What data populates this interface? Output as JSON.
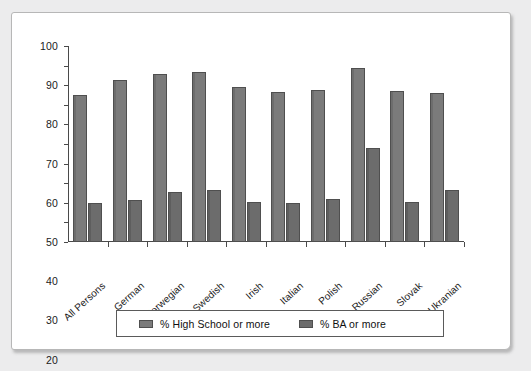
{
  "chart_data": {
    "type": "bar",
    "title": "",
    "subtitle": "",
    "xlabel": "",
    "ylabel": "",
    "ylim": [
      0,
      100
    ],
    "yticks": [
      0,
      10,
      20,
      30,
      40,
      50,
      60,
      70,
      80,
      90,
      100
    ],
    "grid": false,
    "legend_position": "bottom",
    "categories": [
      "All Persons",
      "German",
      "Norwegian",
      "Swedish",
      "Irish",
      "Italian",
      "Polish",
      "Russian",
      "Slovak",
      "Ukranian"
    ],
    "series": [
      {
        "name": "% High School or more",
        "color": "#7b7b7b",
        "values": [
          75,
          82.5,
          85.5,
          86.5,
          79,
          76.5,
          77.5,
          89,
          77,
          76
        ]
      },
      {
        "name": "% BA or more",
        "color": "#6c6c6c",
        "values": [
          20,
          21.5,
          25.5,
          26.5,
          20.5,
          20,
          22,
          48,
          20.5,
          26.5
        ]
      }
    ]
  },
  "legend": {
    "entries": [
      {
        "label": "% High School or more"
      },
      {
        "label": "% BA or more"
      }
    ]
  }
}
